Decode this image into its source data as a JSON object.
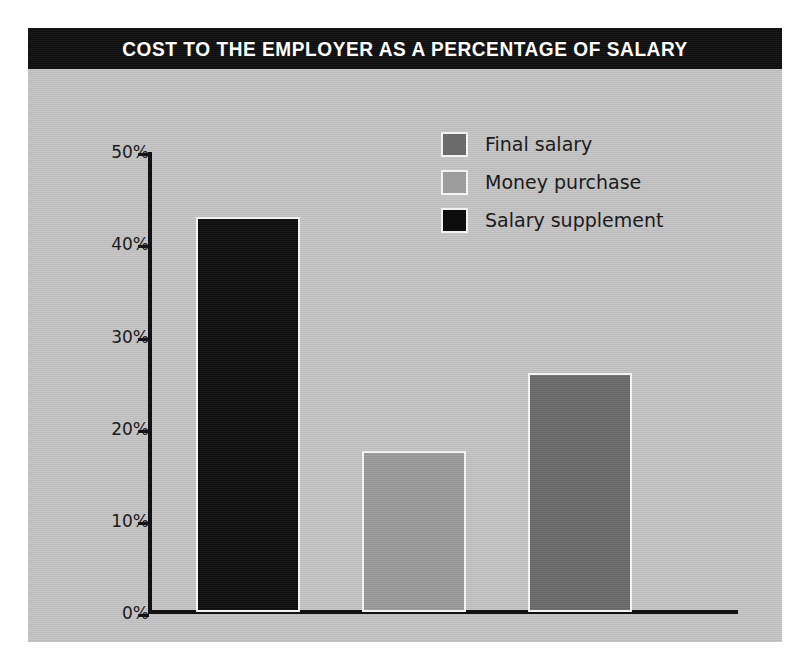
{
  "chart_data": {
    "type": "bar",
    "title": "COST TO THE EMPLOYER AS A PERCENTAGE OF SALARY",
    "xlabel": "",
    "ylabel": "",
    "ylim": [
      0,
      50
    ],
    "yticks": [
      "0%",
      "10%",
      "20%",
      "30%",
      "40%",
      "50%"
    ],
    "ytick_values": [
      0,
      10,
      20,
      30,
      40,
      50
    ],
    "grid": false,
    "legend_position": "top-right",
    "categories": [
      "Salary supplement",
      "Money purchase",
      "Final salary"
    ],
    "values": [
      43,
      17.5,
      26
    ],
    "series": [
      {
        "name": "Salary supplement",
        "value": 43,
        "color": "#0d0d0d"
      },
      {
        "name": "Money purchase",
        "value": 17.5,
        "color": "#9c9c9c"
      },
      {
        "name": "Final salary",
        "value": 26,
        "color": "#6b6b6b"
      }
    ],
    "legend": [
      {
        "label": "Final salary",
        "color": "#6b6b6b"
      },
      {
        "label": "Money purchase",
        "color": "#9c9c9c"
      },
      {
        "label": "Salary supplement",
        "color": "#0d0d0d"
      }
    ]
  },
  "colors": {
    "page_background": "#ffffff",
    "panel_background": "#c4c4c4",
    "title_banner": "#111111",
    "title_text": "#ffffff",
    "axis": "#121212",
    "bar_outline": "#f2f2f2"
  }
}
